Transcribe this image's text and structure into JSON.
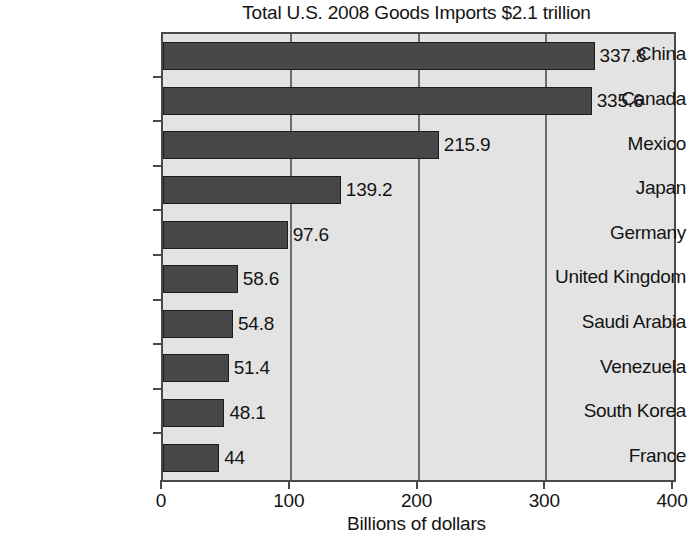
{
  "chart_data": {
    "type": "bar",
    "orientation": "horizontal",
    "title": "Total U.S. 2008 Goods Imports $2.1 trillion",
    "xlabel": "Billions of dollars",
    "ylabel": "",
    "xlim": [
      0,
      400
    ],
    "xticks": [
      0,
      100,
      200,
      300,
      400
    ],
    "xtick_labels": [
      "0",
      "100",
      "200",
      "300",
      "400"
    ],
    "grid": true,
    "grid_axis": "x",
    "legend": false,
    "categories": [
      "China",
      "Canada",
      "Mexico",
      "Japan",
      "Germany",
      "United Kingdom",
      "Saudi Arabia",
      "Venezuela",
      "South Korea",
      "France"
    ],
    "values": [
      337.8,
      335.6,
      215.9,
      139.2,
      97.6,
      58.6,
      54.8,
      51.4,
      48.1,
      44
    ],
    "value_labels": [
      "337.8",
      "335.6",
      "215.9",
      "139.2",
      "97.6",
      "58.6",
      "54.8",
      "51.4",
      "48.1",
      "44"
    ]
  },
  "style": {
    "bar_color": "#474747",
    "bar_edge_color": "#1c1c1c",
    "plot_background": "#e3e3e3",
    "axis_color": "#4a4a4a",
    "gridline_color": "#6d6d6d",
    "text_color": "#141414",
    "page_background": "#ffffff"
  }
}
